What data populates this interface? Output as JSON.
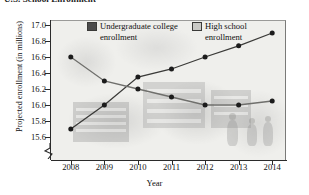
{
  "figure": {
    "cut_off_heading": "U.S. School Enrollment",
    "background_description": "faded grayscale photo collage of school buildings and students"
  },
  "chart_data": {
    "type": "line",
    "title": "",
    "xlabel": "Year",
    "ylabel": "Projected enrollment (in millions)",
    "categories": [
      2008,
      2009,
      2010,
      2011,
      2012,
      2013,
      2014
    ],
    "x_tick_labels": [
      "2008",
      "2009",
      "2010",
      "2011",
      "2012",
      "2013",
      "2014"
    ],
    "y_tick_labels": [
      "15.6",
      "15.8",
      "16.0",
      "16.2",
      "16.4",
      "16.6",
      "16.8",
      "17.0"
    ],
    "y_tick_values": [
      15.6,
      15.8,
      16.0,
      16.2,
      16.4,
      16.6,
      16.8,
      17.0
    ],
    "ylim": [
      15.5,
      17.05
    ],
    "y_axis_break": true,
    "grid": false,
    "legend_position": "top-inside",
    "series": [
      {
        "name": "Undergraduate college enrollment",
        "color": "#4b4b4b",
        "marker": "circle",
        "values": [
          15.7,
          16.0,
          16.35,
          16.45,
          16.6,
          16.74,
          16.9
        ]
      },
      {
        "name": "High school enrollment",
        "color": "#c9c9c5",
        "marker": "circle",
        "values": [
          16.6,
          16.3,
          16.2,
          16.1,
          16.0,
          16.0,
          16.05
        ]
      }
    ]
  },
  "legend": {
    "entries": [
      {
        "label": "Undergraduate college enrollment",
        "swatch_color": "#4b4b4b"
      },
      {
        "label": "High school enrollment",
        "swatch_color": "#c9c9c5"
      }
    ]
  }
}
